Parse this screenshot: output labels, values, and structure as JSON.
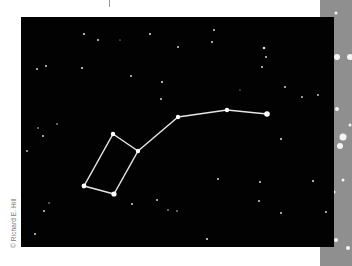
{
  "figure": {
    "credit": "© Richard E. Hill",
    "colors": {
      "sky": "#020202",
      "line": "#e6e6e6",
      "star": "#ffffff",
      "side_strip": "#8f8f8f"
    }
  },
  "constellation": {
    "name": "Big Dipper",
    "stars": [
      {
        "id": "bowl-top-left",
        "x": 113,
        "y": 134,
        "r": 2.2
      },
      {
        "id": "bowl-top-right",
        "x": 138,
        "y": 151,
        "r": 2.2
      },
      {
        "id": "bowl-bottom-left",
        "x": 84,
        "y": 186,
        "r": 2.4
      },
      {
        "id": "bowl-bottom-right",
        "x": 114,
        "y": 194,
        "r": 2.6
      },
      {
        "id": "handle-1",
        "x": 178,
        "y": 117,
        "r": 2.2
      },
      {
        "id": "handle-2",
        "x": 227,
        "y": 110,
        "r": 2.2
      },
      {
        "id": "handle-end",
        "x": 267,
        "y": 114,
        "r": 2.8
      }
    ],
    "lines": [
      [
        "bowl-top-left",
        "bowl-top-right"
      ],
      [
        "bowl-top-right",
        "bowl-bottom-right"
      ],
      [
        "bowl-bottom-right",
        "bowl-bottom-left"
      ],
      [
        "bowl-bottom-left",
        "bowl-top-left"
      ],
      [
        "bowl-top-right",
        "handle-1"
      ],
      [
        "handle-1",
        "handle-2"
      ],
      [
        "handle-2",
        "handle-end"
      ]
    ]
  },
  "background_stars": [
    [
      84,
      34,
      1.1
    ],
    [
      98,
      40,
      1.0
    ],
    [
      150,
      34,
      1.1
    ],
    [
      37,
      69,
      1.0
    ],
    [
      46,
      66,
      1.0
    ],
    [
      82,
      68,
      1.1
    ],
    [
      131,
      76,
      1.0
    ],
    [
      162,
      82,
      1.1
    ],
    [
      161,
      99,
      1.0
    ],
    [
      178,
      47,
      1.0
    ],
    [
      214,
      30,
      1.0
    ],
    [
      212,
      42,
      1.0
    ],
    [
      264,
      48,
      1.3
    ],
    [
      266,
      57,
      1.0
    ],
    [
      262,
      67,
      1.0
    ],
    [
      285,
      87,
      1.0
    ],
    [
      302,
      97,
      0.9
    ],
    [
      318,
      95,
      0.9
    ],
    [
      38,
      128,
      0.8
    ],
    [
      43,
      136,
      1.0
    ],
    [
      27,
      151,
      0.9
    ],
    [
      57,
      124,
      0.8
    ],
    [
      44,
      211,
      1.0
    ],
    [
      35,
      234,
      1.0
    ],
    [
      49,
      203,
      0.7
    ],
    [
      132,
      204,
      1.0
    ],
    [
      157,
      200,
      1.0
    ],
    [
      168,
      210,
      0.8
    ],
    [
      177,
      211,
      0.8
    ],
    [
      260,
      182,
      1.0
    ],
    [
      259,
      201,
      1.0
    ],
    [
      281,
      213,
      1.0
    ],
    [
      313,
      181,
      1.1
    ],
    [
      326,
      212,
      1.0
    ],
    [
      207,
      239,
      1.1
    ],
    [
      281,
      139,
      1.1
    ],
    [
      218,
      179,
      1.0
    ],
    [
      120,
      40,
      0.6
    ],
    [
      240,
      90,
      0.6
    ]
  ],
  "side_strip_stars": [
    [
      337,
      57,
      3
    ],
    [
      350,
      57,
      3
    ],
    [
      336,
      13,
      1.5
    ],
    [
      337,
      109,
      2
    ],
    [
      343,
      137,
      3.5
    ],
    [
      340,
      146,
      3
    ],
    [
      350,
      125,
      1.5
    ],
    [
      343,
      180,
      1.5
    ],
    [
      334,
      192,
      1.5
    ],
    [
      336,
      240,
      2
    ],
    [
      348,
      248,
      2
    ]
  ]
}
